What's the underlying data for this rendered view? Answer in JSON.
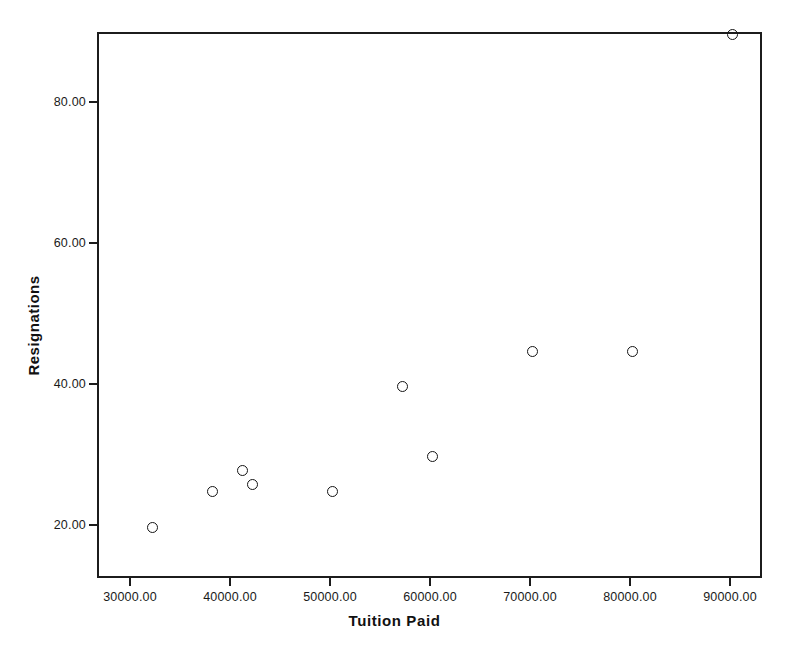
{
  "chart_data": {
    "type": "scatter",
    "title": "",
    "xlabel": "Tuition Paid",
    "ylabel": "Resignations",
    "xlim": [
      26700,
      93200
    ],
    "ylim": [
      12.5,
      90.0
    ],
    "grid": false,
    "legend": null,
    "marker_style": "open-circle",
    "x": [
      32000,
      38000,
      41000,
      42000,
      50000,
      57000,
      60000,
      70000,
      80000,
      90000
    ],
    "y": [
      20,
      25,
      28,
      26,
      25,
      40,
      30,
      45,
      45,
      90
    ],
    "points": [
      {
        "x": 32000,
        "y": 20
      },
      {
        "x": 38000,
        "y": 25
      },
      {
        "x": 41000,
        "y": 28
      },
      {
        "x": 42000,
        "y": 26
      },
      {
        "x": 50000,
        "y": 25
      },
      {
        "x": 57000,
        "y": 40
      },
      {
        "x": 60000,
        "y": 30
      },
      {
        "x": 70000,
        "y": 45
      },
      {
        "x": 80000,
        "y": 45
      },
      {
        "x": 90000,
        "y": 90
      }
    ],
    "xticks": [
      30000,
      40000,
      50000,
      60000,
      70000,
      80000,
      90000
    ],
    "xticklabels": [
      "30000.00",
      "40000.00",
      "50000.00",
      "60000.00",
      "70000.00",
      "80000.00",
      "90000.00"
    ],
    "yticks": [
      20,
      40,
      60,
      80
    ],
    "yticklabels": [
      "20.00",
      "40.00",
      "60.00",
      "80.00"
    ]
  },
  "style": {
    "frame_color": "#1c1c1c",
    "marker_color": "#141414",
    "plot_background": "#ffffff",
    "page_background": "#ffffff",
    "text_color": "#1a1a1a"
  }
}
